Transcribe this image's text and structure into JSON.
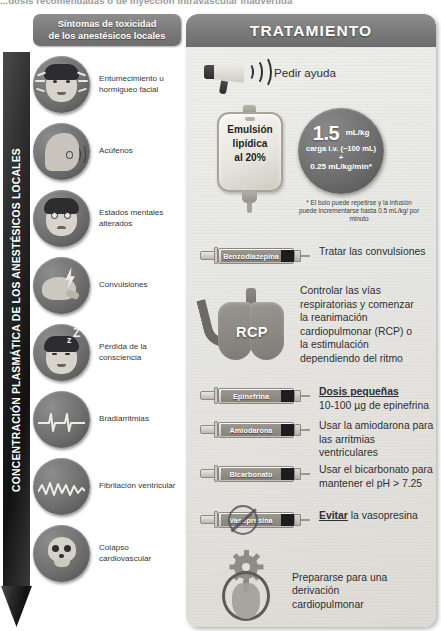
{
  "top_caption": "...dosis recomendadas o de inyección intravascular inadvertida",
  "axis": {
    "label": "CONCENTRACIÓN PLASMÁTICA DE LOS ANESTÉSICOS LOCALES"
  },
  "symptoms_panel": {
    "header_line1": "Síntomas de toxicidad",
    "header_line2": "de los anestésicos locales",
    "items": [
      {
        "icon": "face-tingling-icon",
        "label": "Entumecimiento u hormigueo facial"
      },
      {
        "icon": "ear-tinnitus-icon",
        "label": "Acúfenos"
      },
      {
        "icon": "altered-mental-state-face-icon",
        "label": "Estados mentales alterados"
      },
      {
        "icon": "brain-seizure-icon",
        "label": "Convulsiones"
      },
      {
        "icon": "sleeping-face-zzz-icon",
        "label": "Pérdida de la consciencia"
      },
      {
        "icon": "ecg-bradyarrhythmia-icon",
        "label": "Bradiarritmias"
      },
      {
        "icon": "ecg-ventricular-fibrillation-icon",
        "label": "Fibrilación ventricular"
      },
      {
        "icon": "skull-cardiovascular-collapse-icon",
        "label": "Colapso cardiovascular"
      }
    ]
  },
  "treatment_panel": {
    "title": "TRATAMIENTO",
    "help": {
      "icon": "megaphone-icon",
      "text": "Pedir ayuda"
    },
    "lipid": {
      "bag_icon": "iv-bag-icon",
      "bag_line1": "Emulsión",
      "bag_line2": "lipídica",
      "bag_line3": "al 20%",
      "dose_value": "1.5",
      "dose_unit": "mL/kg",
      "dose_sub": "carga i.v. (~100 mL)",
      "dose_plus": "+",
      "dose_rate": "0.25 mL/kg/min*",
      "footnote": "* El bolo puede repetirse y la infusión puede incrementarse hasta 0.5 mL/kg/ por minuto"
    },
    "steps": [
      {
        "icon": "syringe-icon",
        "drug": "Benzodiazepina",
        "text": "Tratar las convulsiones",
        "prohibited": false
      },
      {
        "icon": "syringe-icon",
        "drug": "Epinefrina",
        "text_bold": "Dosis pequeñas",
        "text": "10-100 µg de epinefrina",
        "prohibited": false
      },
      {
        "icon": "syringe-icon",
        "drug": "Amiodarona",
        "text": "Usar la amiodarona para las arritmias ventriculares",
        "prohibited": false
      },
      {
        "icon": "syringe-icon",
        "drug": "Bicarbonato",
        "text": "Usar el bicarbonato para mantener el pH > 7.25",
        "prohibited": false
      },
      {
        "icon": "syringe-prohibited-icon",
        "drug": "Vasopresina",
        "text_bold": "Evitar",
        "text": " la vasopresina",
        "prohibited": true
      }
    ],
    "rcp": {
      "icon": "lungs-airway-icon",
      "word": "RCP",
      "text": "Controlar las vías respiratorias y comenzar la reanimación cardiopulmonar (RCP) o la estimulación dependiendo del ritmo"
    },
    "bypass": {
      "icon": "cardiopulmonary-bypass-icon",
      "text": "Prepararse para una derivación cardiopulmonar"
    }
  },
  "colors": {
    "panel_header": "#7c7c7c",
    "arrow": "#1f1f1f",
    "bubble": "#6f6f6f",
    "panel_bg": "#e9e8e4",
    "text": "#2f2f33"
  }
}
